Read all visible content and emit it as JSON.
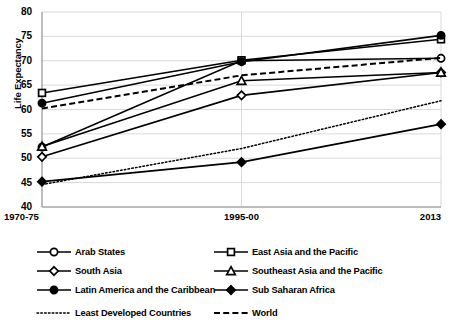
{
  "chart_data": {
    "type": "line",
    "title": "",
    "xlabel": "",
    "ylabel": "Life Expectancy",
    "categories": [
      "1970-75",
      "1995-00",
      "2013"
    ],
    "ylim": [
      40,
      80
    ],
    "yticks": [
      40,
      45,
      50,
      55,
      60,
      65,
      70,
      75,
      80
    ],
    "grid": true,
    "legend_position": "bottom",
    "series": [
      {
        "name": "Arab States",
        "values": [
          52.3,
          70.0,
          70.5
        ],
        "marker": "circle-open",
        "line": "solid"
      },
      {
        "name": "East Asia and the Pacific",
        "values": [
          63.4,
          70.1,
          74.4
        ],
        "marker": "square-open",
        "line": "solid"
      },
      {
        "name": "South Asia",
        "values": [
          50.3,
          62.9,
          67.6
        ],
        "marker": "diamond-open",
        "line": "solid"
      },
      {
        "name": "Southeast Asia and the Pacific",
        "values": [
          52.4,
          65.9,
          67.6
        ],
        "marker": "triangle-open",
        "line": "solid"
      },
      {
        "name": "Latin America and the Caribbean",
        "values": [
          61.3,
          69.8,
          75.2
        ],
        "marker": "circle-filled",
        "line": "solid"
      },
      {
        "name": "Sub Saharan Africa",
        "values": [
          45.2,
          49.2,
          57.0
        ],
        "marker": "diamond-filled",
        "line": "solid"
      },
      {
        "name": "Least Developed Countries",
        "values": [
          44.6,
          52.0,
          61.8
        ],
        "marker": "none",
        "line": "dotted"
      },
      {
        "name": "World",
        "values": [
          60.2,
          67.0,
          70.6
        ],
        "marker": "none",
        "line": "dashed"
      }
    ]
  },
  "axis": {
    "y_title": "Life Expectancy",
    "y_tick_labels": [
      "80",
      "75",
      "70",
      "65",
      "60",
      "55",
      "50",
      "45",
      "40"
    ],
    "x_tick_labels": [
      "1970-75",
      "1995-00",
      "2013"
    ]
  },
  "legend": {
    "items": [
      {
        "label": "Arab States",
        "marker": "circle-open",
        "line": "solid"
      },
      {
        "label": "East Asia and the Pacific",
        "marker": "square-open",
        "line": "solid"
      },
      {
        "label": "South Asia",
        "marker": "diamond-open",
        "line": "solid"
      },
      {
        "label": "Southeast Asia and the Pacific",
        "marker": "triangle-open",
        "line": "solid"
      },
      {
        "label": "Latin America and the Caribbean",
        "marker": "circle-filled",
        "line": "solid"
      },
      {
        "label": "Sub Saharan Africa",
        "marker": "diamond-filled",
        "line": "solid"
      },
      {
        "label": "Least Developed Countries",
        "marker": "none",
        "line": "dotted"
      },
      {
        "label": "World",
        "marker": "none",
        "line": "dashed"
      }
    ]
  },
  "colors": {
    "line": "#000000",
    "grid": "#d9d9d9",
    "background": "#ffffff",
    "text": "#000000"
  }
}
